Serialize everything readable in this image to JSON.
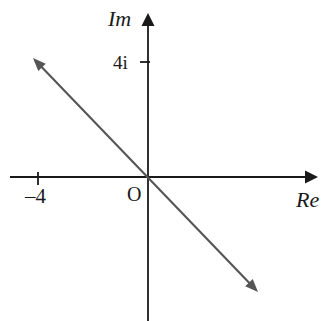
{
  "figure": {
    "background_color": "#ffffff",
    "width": 327,
    "height": 321
  },
  "axes": {
    "imaginary": {
      "label": "Im",
      "label_x": 108,
      "label_y": 26,
      "color": "#1a1a1a",
      "line_x": 148,
      "line_top_y": 13,
      "line_bottom_y": 321
    },
    "real": {
      "label": "Re",
      "label_x": 296,
      "label_y": 207,
      "color": "#1a1a1a",
      "line_y": 177,
      "line_left_x": 10,
      "line_right_x": 318
    },
    "origin": {
      "label": "O",
      "x": 148,
      "y": 177,
      "label_x": 127,
      "label_y": 201
    }
  },
  "ticks": [
    {
      "label": "4i",
      "axis": "imaginary",
      "value": 4,
      "x": 148,
      "y": 62,
      "label_x": 113,
      "label_y": 69,
      "mark_x1": 140,
      "mark_y1": 62,
      "mark_x2": 150,
      "mark_y2": 62
    },
    {
      "label": "–4",
      "axis": "real",
      "value": -4,
      "x": 38,
      "y": 177,
      "label_x": 25,
      "label_y": 203,
      "mark_x1": 38,
      "mark_y1": 172,
      "mark_x2": 38,
      "mark_y2": 185
    }
  ],
  "chart_data": {
    "type": "line",
    "xlabel": "Re",
    "ylabel": "Im",
    "xlim": [
      -17,
      21
    ],
    "ylim": [
      -16,
      18
    ],
    "grid": false,
    "legend": null,
    "axis_tick_labels": {
      "x": [
        "–4"
      ],
      "y": [
        "4i"
      ]
    },
    "annotations": [
      "Im",
      "Re",
      "O",
      "4i",
      "–4"
    ],
    "series": [
      {
        "name": "line through origin",
        "kind": "double-headed-arrow",
        "color": "#555555",
        "slope": -1,
        "intercept": 0,
        "points": [
          {
            "px": 33,
            "py": 58
          },
          {
            "px": 148,
            "py": 177
          },
          {
            "px": 258,
            "py": 292
          }
        ]
      }
    ]
  },
  "line": {
    "color": "#555555",
    "stroke_width": 2.1,
    "start_x": 33,
    "start_y": 58,
    "end_x": 258,
    "end_y": 292
  }
}
